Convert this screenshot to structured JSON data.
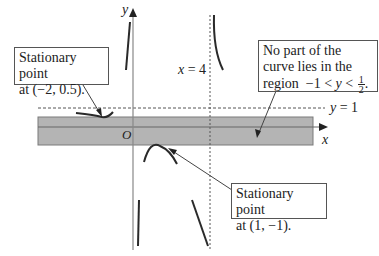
{
  "diagram": {
    "axes": {
      "x_label": "x",
      "y_label": "y",
      "origin_label": "O"
    },
    "asymptotes": {
      "vertical_label_var": "x",
      "vertical_label_eq": "= 4",
      "horizontal_label_var": "y",
      "horizontal_label_eq": "= 1"
    },
    "callouts": {
      "left_stationary": {
        "line1": "Stationary point",
        "line2": "at (−2, 0.5)."
      },
      "region": {
        "line1": "No part of the",
        "line2": "curve lies in the",
        "line3_prefix": "region  −1 < ",
        "line3_var": "y",
        "line3_mid": " < ",
        "frac_num": "1",
        "frac_den": "2",
        "line3_suffix": "."
      },
      "right_stationary": {
        "line1": "Stationary point",
        "line2": "at (1, −1)."
      }
    },
    "colors": {
      "band_fill": "#b4b4b4",
      "band_border": "#7a7a7a",
      "axis": "#888888",
      "curve": "#2a2a2a",
      "dashed": "#555555"
    }
  }
}
